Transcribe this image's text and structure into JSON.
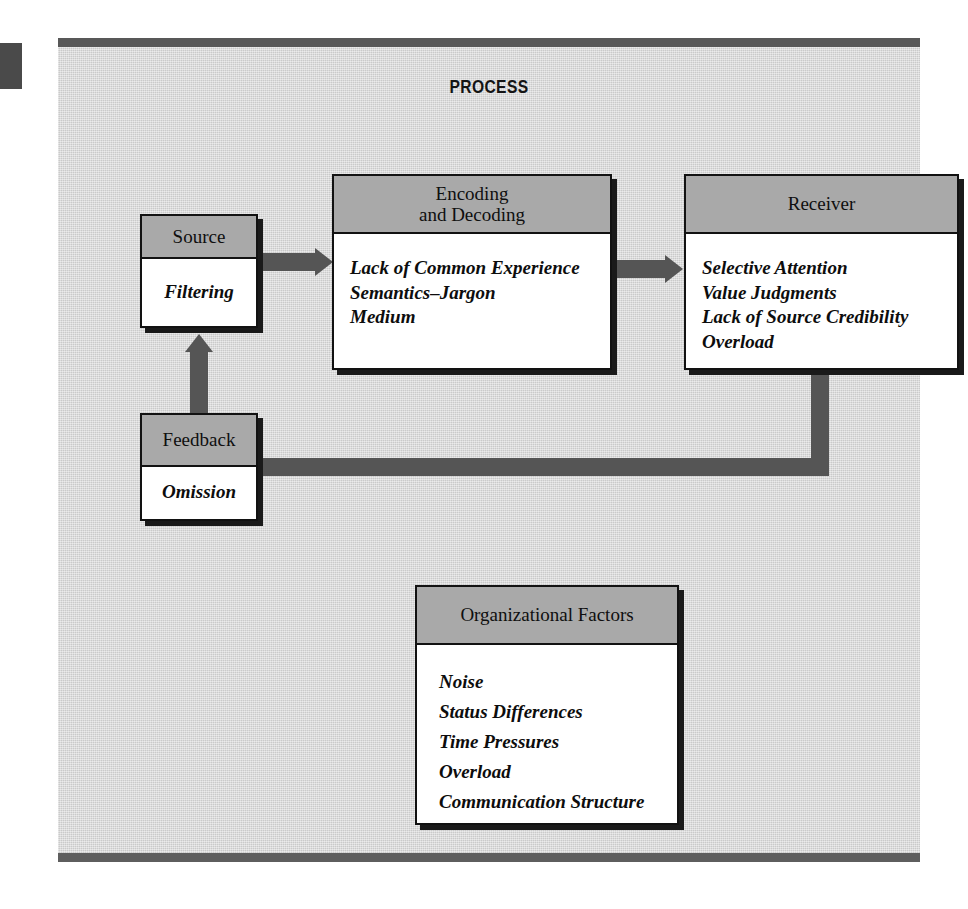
{
  "figure": {
    "title": "PROCESS",
    "background_color": "#d2d2d2",
    "frame_bar_color": "#585858",
    "header_fill_color": "#a9a9a9",
    "arrow_color": "#555555",
    "outline_color": "#121212"
  },
  "nodes": {
    "source": {
      "header": "Source",
      "items": [
        "Filtering"
      ]
    },
    "encoding": {
      "header_line1": "Encoding",
      "header_line2": "and Decoding",
      "items": [
        "Lack of Common Experience",
        "Semantics–Jargon",
        "Medium"
      ]
    },
    "receiver": {
      "header": "Receiver",
      "items": [
        "Selective Attention",
        "Value Judgments",
        "Lack of Source Credibility",
        "Overload"
      ]
    },
    "feedback": {
      "header": "Feedback",
      "items": [
        "Omission"
      ]
    },
    "organizational_factors": {
      "header": "Organizational Factors",
      "items": [
        "Noise",
        "Status Differences",
        "Time Pressures",
        "Overload",
        "Communication Structure"
      ]
    }
  },
  "connectors": [
    {
      "name": "source-to-encoding",
      "from": "source",
      "to": "encoding",
      "direction": "right"
    },
    {
      "name": "encoding-to-receiver",
      "from": "encoding",
      "to": "receiver",
      "direction": "right"
    },
    {
      "name": "receiver-to-feedback",
      "from": "receiver",
      "to": "feedback",
      "direction": "down-then-left"
    },
    {
      "name": "feedback-to-source",
      "from": "feedback",
      "to": "source",
      "direction": "up"
    }
  ]
}
